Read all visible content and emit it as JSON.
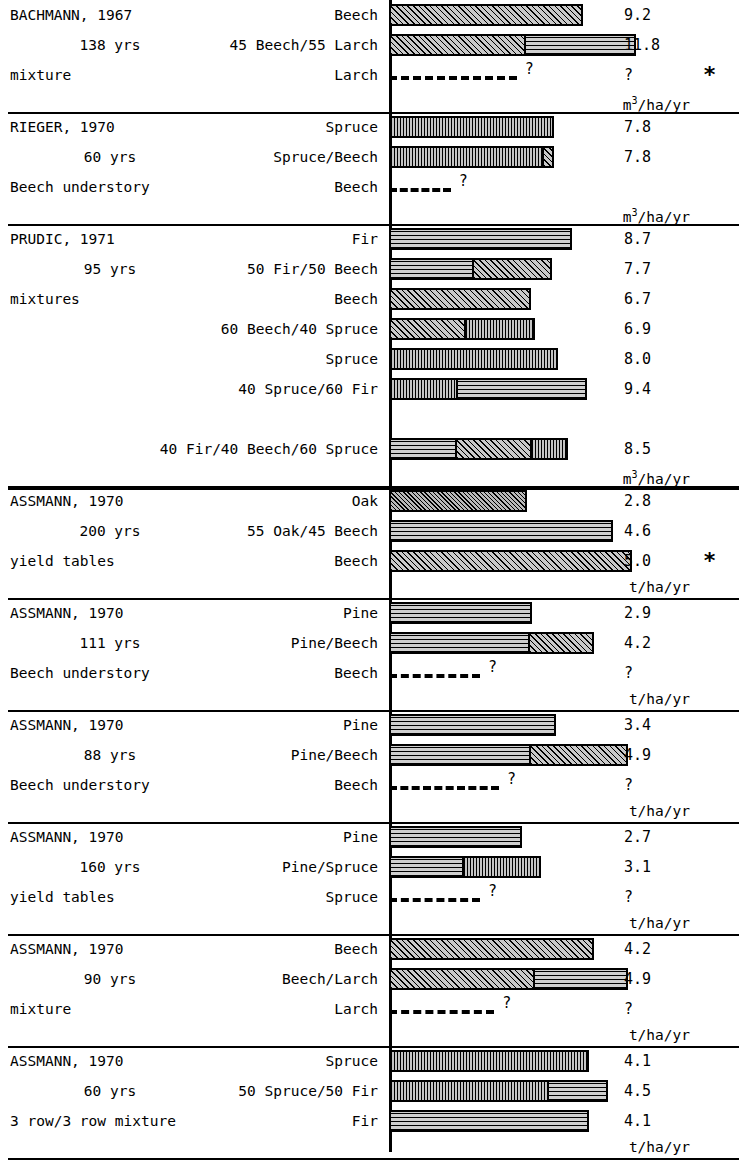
{
  "figure": {
    "axis_origin_label": "0",
    "footnote_marker": "*"
  },
  "units": {
    "volume": "m3/ha/yr",
    "volume_sup": "3",
    "volume_pre": "m",
    "volume_post": "/ha/yr",
    "mass": "t/ha/yr"
  },
  "legend": {
    "patterns": {
      "beech": "diagonal-hatch",
      "larch": "horizontal-hatch",
      "spruce": "vertical-hatch",
      "fir": "horizontal-hatch",
      "pine": "horizontal-hatch",
      "oak": "fine-diagonal-hatch"
    }
  },
  "chart_data": {
    "type": "bar",
    "title": "",
    "xlabel": "",
    "ylabel": "",
    "orientation": "horizontal",
    "grid": false,
    "legend_position": "none",
    "note": "Stacked horizontal bars; each panel is one study. Panels in m3/ha/yr use xmax 13.0; panels in t/ha/yr use xmax 5.6.",
    "panels": [
      {
        "study": "BACHMANN, 1967",
        "age": "138 yrs",
        "note": "mixture",
        "unit": "volume",
        "xmax": 13.0,
        "starred": true,
        "rows": [
          {
            "label": "Beech",
            "value": "9.2",
            "numeric": 9.2,
            "unknown": false,
            "segments": [
              {
                "species": "Beech",
                "pattern": "p-diag",
                "value": 9.2
              }
            ]
          },
          {
            "label": "45 Beech/55 Larch",
            "value": "11.8",
            "numeric": 11.8,
            "unknown": false,
            "segments": [
              {
                "species": "Beech",
                "pattern": "p-diag",
                "value": 6.5
              },
              {
                "species": "Larch",
                "pattern": "p-horiz",
                "value": 5.3
              }
            ]
          },
          {
            "label": "Larch",
            "value": "?",
            "numeric": null,
            "unknown": true,
            "dash_to": 6.2,
            "segments": []
          }
        ]
      },
      {
        "study": "RIEGER, 1970",
        "age": "60 yrs",
        "note": "Beech understory",
        "unit": "volume",
        "xmax": 13.0,
        "starred": false,
        "rows": [
          {
            "label": "Spruce",
            "value": "7.8",
            "numeric": 7.8,
            "unknown": false,
            "segments": [
              {
                "species": "Spruce",
                "pattern": "p-vert",
                "value": 7.8
              }
            ]
          },
          {
            "label": "Spruce/Beech",
            "value": "7.8",
            "numeric": 7.8,
            "unknown": false,
            "segments": [
              {
                "species": "Spruce",
                "pattern": "p-vert",
                "value": 7.4
              },
              {
                "species": "Beech",
                "pattern": "p-diag",
                "value": 0.4
              }
            ]
          },
          {
            "label": "Beech",
            "value": "",
            "numeric": null,
            "unknown": true,
            "dash_to": 3.0,
            "segments": []
          }
        ]
      },
      {
        "study": "PRUDIC, 1971",
        "age": "95 yrs",
        "note": "mixtures",
        "unit": "volume",
        "xmax": 13.0,
        "starred": false,
        "rows": [
          {
            "label": "Fir",
            "value": "8.7",
            "numeric": 8.7,
            "unknown": false,
            "segments": [
              {
                "species": "Fir",
                "pattern": "p-horiz",
                "value": 8.7
              }
            ]
          },
          {
            "label": "50 Fir/50 Beech",
            "value": "7.7",
            "numeric": 7.7,
            "unknown": false,
            "segments": [
              {
                "species": "Fir",
                "pattern": "p-horiz",
                "value": 4.0
              },
              {
                "species": "Beech",
                "pattern": "p-diag",
                "value": 3.7
              }
            ]
          },
          {
            "label": "Beech",
            "value": "6.7",
            "numeric": 6.7,
            "unknown": false,
            "segments": [
              {
                "species": "Beech",
                "pattern": "p-diag",
                "value": 6.7
              }
            ]
          },
          {
            "label": "60 Beech/40 Spruce",
            "value": "6.9",
            "numeric": 6.9,
            "unknown": false,
            "segments": [
              {
                "species": "Beech",
                "pattern": "p-diag",
                "value": 3.6
              },
              {
                "species": "Spruce",
                "pattern": "p-vert",
                "value": 3.3
              }
            ]
          },
          {
            "label": "Spruce",
            "value": "8.0",
            "numeric": 8.0,
            "unknown": false,
            "segments": [
              {
                "species": "Spruce",
                "pattern": "p-vert",
                "value": 8.0
              }
            ]
          },
          {
            "label": "40 Spruce/60 Fir",
            "value": "9.4",
            "numeric": 9.4,
            "unknown": false,
            "segments": [
              {
                "species": "Spruce",
                "pattern": "p-vert",
                "value": 3.2
              },
              {
                "species": "Fir",
                "pattern": "p-horiz",
                "value": 6.2
              }
            ]
          },
          {
            "label": "",
            "value": "",
            "numeric": null,
            "unknown": false,
            "spacer": true,
            "segments": []
          },
          {
            "label": "40 Fir/40 Beech/60 Spruce",
            "value": "8.5",
            "numeric": 8.5,
            "unknown": false,
            "segments": [
              {
                "species": "Fir",
                "pattern": "p-horiz",
                "value": 3.2
              },
              {
                "species": "Beech",
                "pattern": "p-diag",
                "value": 3.6
              },
              {
                "species": "Spruce",
                "pattern": "p-vert",
                "value": 1.7
              }
            ]
          }
        ]
      },
      {
        "study": "ASSMANN, 1970",
        "age": "200 yrs",
        "note": "yield tables",
        "unit": "mass",
        "xmax": 5.6,
        "starred": true,
        "star_row": 2,
        "rows": [
          {
            "label": "Oak",
            "value": "2.8",
            "numeric": 2.8,
            "unknown": false,
            "segments": [
              {
                "species": "Oak",
                "pattern": "p-diag2",
                "value": 2.8
              }
            ]
          },
          {
            "label": "55 Oak/45 Beech",
            "value": "4.6",
            "numeric": 4.6,
            "unknown": false,
            "segments": [
              {
                "species": "Oak/Beech",
                "pattern": "p-horiz",
                "value": 4.6
              }
            ]
          },
          {
            "label": "Beech",
            "value": "5.0",
            "numeric": 5.0,
            "unknown": false,
            "segments": [
              {
                "species": "Beech",
                "pattern": "p-diag",
                "value": 5.0
              }
            ]
          }
        ]
      },
      {
        "study": "ASSMANN, 1970",
        "age": "111 yrs",
        "note": "Beech understory",
        "unit": "mass",
        "xmax": 5.6,
        "starred": false,
        "rows": [
          {
            "label": "Pine",
            "value": "2.9",
            "numeric": 2.9,
            "unknown": false,
            "segments": [
              {
                "species": "Pine",
                "pattern": "p-horiz",
                "value": 2.9
              }
            ]
          },
          {
            "label": "Pine/Beech",
            "value": "4.2",
            "numeric": 4.2,
            "unknown": false,
            "segments": [
              {
                "species": "Pine",
                "pattern": "p-horiz",
                "value": 2.9
              },
              {
                "species": "Beech",
                "pattern": "p-diag",
                "value": 1.3
              }
            ]
          },
          {
            "label": "Beech",
            "value": "?",
            "numeric": null,
            "unknown": true,
            "dash_to": 1.9,
            "segments": []
          }
        ]
      },
      {
        "study": "ASSMANN, 1970",
        "age": "88 yrs",
        "note": "Beech understory",
        "unit": "mass",
        "xmax": 5.6,
        "starred": false,
        "rows": [
          {
            "label": "Pine",
            "value": "3.4",
            "numeric": 3.4,
            "unknown": false,
            "segments": [
              {
                "species": "Pine",
                "pattern": "p-horiz",
                "value": 3.4
              }
            ]
          },
          {
            "label": "Pine/Beech",
            "value": "4.9",
            "numeric": 4.9,
            "unknown": false,
            "segments": [
              {
                "species": "Pine",
                "pattern": "p-horiz",
                "value": 2.9
              },
              {
                "species": "Beech",
                "pattern": "p-diag",
                "value": 2.0
              }
            ]
          },
          {
            "label": "Beech",
            "value": "?",
            "numeric": null,
            "unknown": true,
            "dash_to": 2.3,
            "segments": []
          }
        ]
      },
      {
        "study": "ASSMANN, 1970",
        "age": "160 yrs",
        "note": "yield tables",
        "unit": "mass",
        "xmax": 5.6,
        "starred": false,
        "rows": [
          {
            "label": "Pine",
            "value": "2.7",
            "numeric": 2.7,
            "unknown": false,
            "segments": [
              {
                "species": "Pine",
                "pattern": "p-horiz",
                "value": 2.7
              }
            ]
          },
          {
            "label": "Pine/Spruce",
            "value": "3.1",
            "numeric": 3.1,
            "unknown": false,
            "segments": [
              {
                "species": "Pine",
                "pattern": "p-horiz",
                "value": 1.5
              },
              {
                "species": "Spruce",
                "pattern": "p-vert",
                "value": 1.6
              }
            ]
          },
          {
            "label": "Spruce",
            "value": "?",
            "numeric": null,
            "unknown": true,
            "dash_to": 1.9,
            "segments": []
          }
        ]
      },
      {
        "study": "ASSMANN, 1970",
        "age": "90 yrs",
        "note": "mixture",
        "unit": "mass",
        "xmax": 5.6,
        "starred": false,
        "rows": [
          {
            "label": "Beech",
            "value": "4.2",
            "numeric": 4.2,
            "unknown": false,
            "segments": [
              {
                "species": "Beech",
                "pattern": "p-diag",
                "value": 4.2
              }
            ]
          },
          {
            "label": "Beech/Larch",
            "value": "4.9",
            "numeric": 4.9,
            "unknown": false,
            "segments": [
              {
                "species": "Beech",
                "pattern": "p-diag",
                "value": 3.0
              },
              {
                "species": "Larch",
                "pattern": "p-horiz",
                "value": 1.9
              }
            ]
          },
          {
            "label": "Larch",
            "value": "?",
            "numeric": null,
            "unknown": true,
            "dash_to": 2.2,
            "segments": []
          }
        ]
      },
      {
        "study": "ASSMANN, 1970",
        "age": "60 yrs",
        "note": "3 row/3 row mixture",
        "unit": "mass",
        "xmax": 5.6,
        "starred": false,
        "rows": [
          {
            "label": "Spruce",
            "value": "4.1",
            "numeric": 4.1,
            "unknown": false,
            "segments": [
              {
                "species": "Spruce",
                "pattern": "p-vert",
                "value": 4.1
              }
            ]
          },
          {
            "label": "50 Spruce/50 Fir",
            "value": "4.5",
            "numeric": 4.5,
            "unknown": false,
            "segments": [
              {
                "species": "Spruce",
                "pattern": "p-vert",
                "value": 3.3
              },
              {
                "species": "Fir",
                "pattern": "p-horiz",
                "value": 1.2
              }
            ]
          },
          {
            "label": "Fir",
            "value": "4.1",
            "numeric": 4.1,
            "unknown": false,
            "segments": [
              {
                "species": "Fir",
                "pattern": "p-horiz",
                "value": 4.1
              }
            ]
          }
        ]
      }
    ]
  }
}
